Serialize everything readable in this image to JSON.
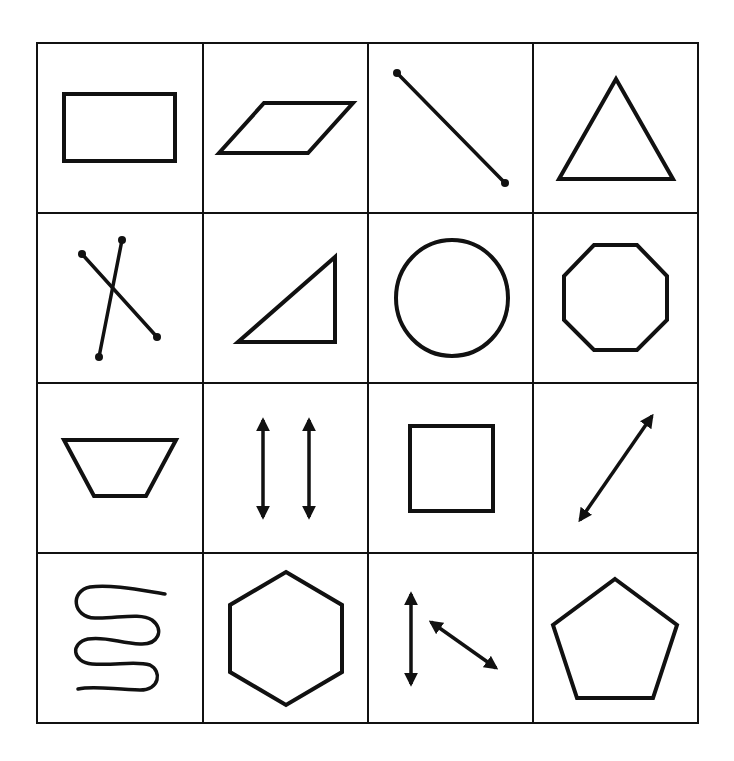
{
  "figure": {
    "type": "shape-grid",
    "rows": 4,
    "columns": 4,
    "grid": {
      "left": 37,
      "top": 43,
      "right": 698,
      "bottom": 723
    },
    "stroke_color": "#111111",
    "background_color": "#ffffff"
  },
  "cells": [
    {
      "row": 1,
      "col": 1,
      "shape": "rectangle"
    },
    {
      "row": 1,
      "col": 2,
      "shape": "parallelogram"
    },
    {
      "row": 1,
      "col": 3,
      "shape": "line-segment"
    },
    {
      "row": 1,
      "col": 4,
      "shape": "triangle"
    },
    {
      "row": 2,
      "col": 1,
      "shape": "intersecting-line-segments"
    },
    {
      "row": 2,
      "col": 2,
      "shape": "right-triangle"
    },
    {
      "row": 2,
      "col": 3,
      "shape": "circle"
    },
    {
      "row": 2,
      "col": 4,
      "shape": "octagon"
    },
    {
      "row": 3,
      "col": 1,
      "shape": "trapezoid"
    },
    {
      "row": 3,
      "col": 2,
      "shape": "parallel-lines"
    },
    {
      "row": 3,
      "col": 3,
      "shape": "square"
    },
    {
      "row": 3,
      "col": 4,
      "shape": "line"
    },
    {
      "row": 4,
      "col": 1,
      "shape": "curve"
    },
    {
      "row": 4,
      "col": 2,
      "shape": "hexagon"
    },
    {
      "row": 4,
      "col": 3,
      "shape": "non-parallel-lines"
    },
    {
      "row": 4,
      "col": 4,
      "shape": "pentagon"
    }
  ]
}
